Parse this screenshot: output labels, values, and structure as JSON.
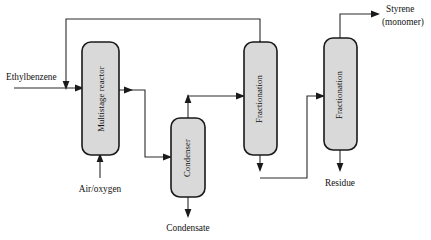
{
  "diagram": {
    "background_color": "#ffffff",
    "vessel_fill_color": "#d9d9d9",
    "vessel_border_color": "#1a1a1a",
    "line_color": "#2b2b2b",
    "units": [
      {
        "id": "multistage-reactor",
        "label": "Multistage reactor",
        "orientation": "vertical-text"
      },
      {
        "id": "condenser",
        "label": "Condenser",
        "orientation": "vertical-text"
      },
      {
        "id": "fractionation-1",
        "label": "Fractionation",
        "orientation": "vertical-text"
      },
      {
        "id": "fractionation-2",
        "label": "Fractionation",
        "orientation": "vertical-text"
      }
    ],
    "streams": [
      {
        "id": "feed-ethylbenzene",
        "label": "Ethylbenzene"
      },
      {
        "id": "feed-air-oxygen",
        "label": "Air/oxygen"
      },
      {
        "id": "product-condensate",
        "label": "Condensate"
      },
      {
        "id": "product-styrene-line1",
        "label": "Styrene"
      },
      {
        "id": "product-styrene-line2",
        "label": "(monomer)"
      },
      {
        "id": "product-residue",
        "label": "Residue"
      }
    ]
  }
}
